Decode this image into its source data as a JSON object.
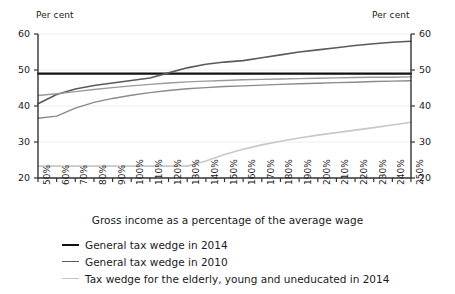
{
  "chart_data": {
    "type": "line",
    "title": "",
    "xlabel": "Gross income as a percentage of the average wage",
    "ylabel_left": "Per cent",
    "ylabel_right": "Per cent",
    "ylim": [
      20,
      60
    ],
    "yticks": [
      20,
      30,
      40,
      50,
      60
    ],
    "ytick_labels": [
      "20",
      "30",
      "40",
      "50",
      "60"
    ],
    "grid": true,
    "legend_position": "bottom-left",
    "categories": [
      "50%",
      "60%",
      "70%",
      "80%",
      "90%",
      "100%",
      "110%",
      "120%",
      "130%",
      "140%",
      "150%",
      "160%",
      "170%",
      "180%",
      "190%",
      "200%",
      "210%",
      "220%",
      "230%",
      "240%",
      "250%"
    ],
    "x": [
      50,
      60,
      70,
      80,
      90,
      100,
      110,
      120,
      130,
      140,
      150,
      160,
      170,
      180,
      190,
      200,
      210,
      220,
      230,
      240,
      250
    ],
    "series": [
      {
        "name": "General tax wedge in 2014",
        "color": "#111111",
        "width": 2.2,
        "values": [
          49.0,
          49.0,
          49.0,
          49.0,
          49.0,
          49.0,
          49.0,
          49.0,
          49.0,
          49.0,
          49.0,
          49.0,
          49.0,
          49.0,
          49.0,
          49.0,
          49.0,
          49.0,
          49.0,
          49.0,
          49.0
        ]
      },
      {
        "name": "General tax wedge in 2010",
        "color": "#5a5a5a",
        "width": 1.6,
        "values": [
          40.6,
          43.2,
          44.7,
          45.7,
          46.4,
          47.1,
          47.8,
          49.2,
          50.6,
          51.6,
          52.2,
          52.6,
          53.4,
          54.2,
          55.0,
          55.6,
          56.2,
          56.8,
          57.3,
          57.7,
          58.0
        ]
      },
      {
        "name": "Tax wedge mid upper",
        "color": "#9a9a9a",
        "width": 1.4,
        "values": [
          42.9,
          43.4,
          44.0,
          44.6,
          45.1,
          45.6,
          46.0,
          46.4,
          46.7,
          46.9,
          47.1,
          47.3,
          47.4,
          47.5,
          47.6,
          47.7,
          47.8,
          47.9,
          48.0,
          48.0,
          48.1
        ]
      },
      {
        "name": "Tax wedge mid lower",
        "color": "#8a8a8a",
        "width": 1.4,
        "values": [
          36.6,
          37.2,
          39.4,
          41.0,
          42.1,
          43.0,
          43.7,
          44.3,
          44.8,
          45.1,
          45.4,
          45.6,
          45.8,
          46.0,
          46.2,
          46.3,
          46.5,
          46.6,
          46.8,
          46.9,
          47.0
        ]
      },
      {
        "name": "Tax wedge for the elderly, young and uneducated in 2014",
        "color": "#c8c8c8",
        "width": 1.6,
        "values": [
          23.3,
          23.3,
          23.3,
          23.3,
          23.3,
          23.3,
          23.3,
          23.3,
          23.3,
          24.7,
          26.5,
          28.0,
          29.2,
          30.2,
          31.1,
          31.9,
          32.6,
          33.3,
          34.0,
          34.7,
          35.5
        ]
      }
    ]
  },
  "legend": {
    "items": [
      {
        "label": "General tax wedge in 2014",
        "color": "#111111",
        "width": "2.5px"
      },
      {
        "label": "General tax wedge in 2010",
        "color": "#5a5a5a",
        "width": "1.8px"
      },
      {
        "label": "Tax wedge for the elderly, young and uneducated in 2014",
        "color": "#c4c4c4",
        "width": "1.8px"
      }
    ]
  }
}
